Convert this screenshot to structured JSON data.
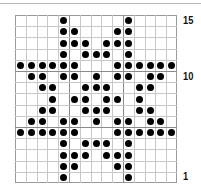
{
  "chart": {
    "title": "",
    "columns": 15,
    "rows": 15,
    "row_labels": [
      {
        "row": 15,
        "text": "15"
      },
      {
        "row": 10,
        "text": "10"
      },
      {
        "row": 1,
        "text": "1"
      }
    ],
    "bold_col_lines_after": [
      4,
      9
    ],
    "bold_row_lines_between": [
      [
        11,
        10
      ],
      [
        6,
        5
      ]
    ],
    "dot_color": "#000000",
    "grid_color": "#c8c8c8"
  },
  "chart_data": {
    "type": "table",
    "xlabel": "",
    "ylabel": "Row",
    "tick_labels": [
      "15",
      "10",
      "1"
    ],
    "grid": true,
    "legend": [],
    "rows": [
      {
        "row": 15,
        "dots": [
          4,
          10
        ]
      },
      {
        "row": 14,
        "dots": [
          4,
          5,
          9,
          10
        ]
      },
      {
        "row": 13,
        "dots": [
          4,
          5,
          6,
          8,
          9,
          10
        ]
      },
      {
        "row": 12,
        "dots": [
          4,
          6,
          7,
          8,
          10
        ]
      },
      {
        "row": 11,
        "dots": [
          0,
          1,
          2,
          3,
          4,
          5,
          9,
          10,
          11,
          12,
          13,
          14
        ]
      },
      {
        "row": 10,
        "dots": [
          1,
          2,
          4,
          5,
          7,
          9,
          10,
          12,
          13
        ]
      },
      {
        "row": 9,
        "dots": [
          2,
          3,
          6,
          7,
          8,
          11,
          12
        ]
      },
      {
        "row": 8,
        "dots": [
          3,
          5,
          6,
          8,
          9,
          11
        ]
      },
      {
        "row": 7,
        "dots": [
          2,
          3,
          6,
          7,
          8,
          11,
          12
        ]
      },
      {
        "row": 6,
        "dots": [
          1,
          2,
          4,
          5,
          7,
          9,
          10,
          12,
          13
        ]
      },
      {
        "row": 5,
        "dots": [
          0,
          1,
          2,
          3,
          4,
          5,
          9,
          10,
          11,
          12,
          13,
          14
        ]
      },
      {
        "row": 4,
        "dots": [
          4,
          6,
          7,
          8,
          10
        ]
      },
      {
        "row": 3,
        "dots": [
          4,
          5,
          6,
          8,
          9,
          10
        ]
      },
      {
        "row": 2,
        "dots": [
          4,
          5,
          9,
          10
        ]
      },
      {
        "row": 1,
        "dots": [
          4,
          10
        ]
      }
    ]
  }
}
